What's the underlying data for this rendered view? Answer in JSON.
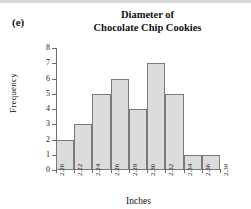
{
  "panel": {
    "label": "(e)"
  },
  "chart_data": {
    "type": "bar",
    "title": "Diameter of Chocolate Chip Cookies",
    "title_line1": "Diameter of",
    "title_line2": "Chocolate Chip Cookies",
    "xlabel": "Inches",
    "ylabel": "Frequency",
    "bin_edges": [
      "2.20",
      "2.22",
      "2.24",
      "2.26",
      "2.28",
      "2.30",
      "2.32",
      "2.34",
      "2.36",
      "2.38"
    ],
    "categories": [
      "2.20-2.22",
      "2.22-2.24",
      "2.24-2.26",
      "2.26-2.28",
      "2.28-2.30",
      "2.30-2.32",
      "2.32-2.34",
      "2.34-2.36",
      "2.36-2.38"
    ],
    "values": [
      2,
      3,
      5,
      6,
      4,
      7,
      5,
      1,
      1
    ],
    "ylim": [
      0,
      8
    ],
    "yticks": [
      "0",
      "1",
      "2",
      "3",
      "4",
      "5",
      "6",
      "7",
      "8"
    ],
    "xlim": [
      2.2,
      2.38
    ],
    "grid": false,
    "legend": false,
    "bar_fill_color": "#dcdcdc",
    "bar_edge_color": "#7a7a7a",
    "axis_color": "#6e6e6e"
  }
}
